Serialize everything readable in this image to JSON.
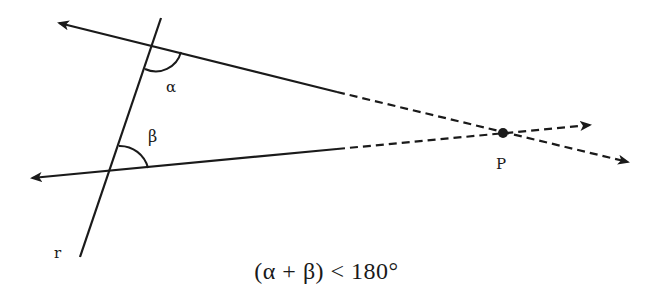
{
  "diagram": {
    "labels": {
      "alpha": "α",
      "beta": "β",
      "point": "P",
      "transversal": "r"
    },
    "caption": "(α + β) < 180°",
    "colors": {
      "stroke": "#1a1a1a",
      "background": "#ffffff"
    },
    "geometry": {
      "transversal_r": {
        "from": [
          161,
          18
        ],
        "to": [
          80,
          257
        ]
      },
      "upper_line": {
        "arrow_left": [
          57,
          22
        ],
        "solid_end": [
          337,
          92
        ],
        "arrow_right": [
          630,
          163
        ]
      },
      "lower_line": {
        "arrow_left": [
          30,
          178
        ],
        "solid_end": [
          337,
          149
        ],
        "arrow_right": [
          592,
          125
        ]
      },
      "intersection_P": [
        503,
        133
      ]
    }
  }
}
